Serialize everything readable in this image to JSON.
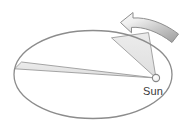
{
  "figure": {
    "background_color": "#ffffff",
    "width": 186,
    "height": 126
  },
  "orbit": {
    "name": "elliptical-orbit",
    "shape": "ellipse",
    "center_x": 93,
    "center_y": 74.5,
    "radius_x": 79,
    "radius_y": 44,
    "stroke_color": "#8c8c8c",
    "stroke_width": 1.3,
    "fill": "none"
  },
  "sun": {
    "label": "Sun",
    "marker_color": "#fbfbfb",
    "marker_stroke": "#8a8a8a",
    "center_x": 156,
    "center_y": 78,
    "radius": 3.6,
    "label_x": 153,
    "label_y": 94,
    "label_color": "#3a3a3a"
  },
  "sectors": [
    {
      "name": "swept-area-aphelion",
      "description": "Thin wedge swept near aphelion on the far left of the orbit",
      "fill_color": "#e3e3e3",
      "stroke_color": "#9a9a9a",
      "points": "156,78 14.5,68.5 22,62.5"
    },
    {
      "name": "swept-area-perihelion",
      "description": "Wide wedge swept near perihelion close to the Sun",
      "fill_color": "#e3e3e3",
      "stroke_color": "#9a9a9a",
      "points": "156,78 112,37.5 148,32.5"
    }
  ],
  "direction_arrow": {
    "name": "orbital-direction-arrow",
    "description": "Curved banner arrow above the orbit showing counter-clockwise revolution",
    "fill_gradient_start": "#f4f4f4",
    "fill_gradient_end": "#a7a7a7",
    "stroke_color": "#8e8e8e",
    "points_label": "arrow-head-upper-left"
  },
  "colors": {
    "outline": "#8c8c8c",
    "sector_fill": "#e3e3e3",
    "arrow_light": "#f4f4f4",
    "arrow_dark": "#a7a7a7",
    "text": "#3a3a3a",
    "background": "#ffffff"
  }
}
